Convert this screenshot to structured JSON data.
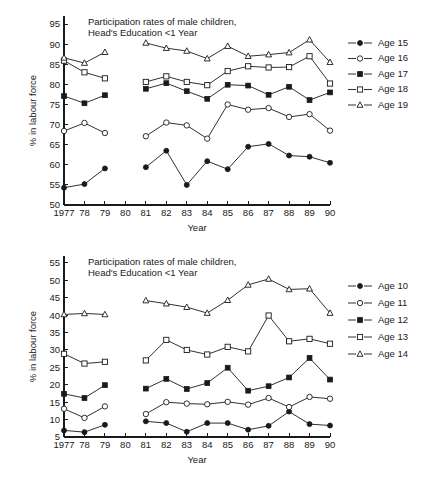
{
  "figure": {
    "background": "#ffffff",
    "ink_color": "#1a1a1a"
  },
  "chart_data": [
    {
      "id": "top",
      "type": "line",
      "title": "Participation rates of male children,\nHead's Education <1 Year",
      "title_line1": "Participation rates of male children,",
      "title_line2": "Head's Education <1 Year",
      "xlabel": "Year",
      "ylabel": "% in labour force",
      "ylim": [
        50,
        97
      ],
      "yticks": [
        50,
        55,
        60,
        65,
        70,
        75,
        80,
        85,
        90,
        95
      ],
      "ytick_labels": [
        "50",
        "55",
        "60",
        "65",
        "70",
        "75",
        "80",
        "85",
        "90",
        "95"
      ],
      "x": [
        1977,
        1978,
        1979,
        1980,
        1981,
        1982,
        1983,
        1984,
        1985,
        1986,
        1987,
        1988,
        1989,
        1990
      ],
      "xtick_labels": [
        "1977",
        "78",
        "79",
        "80",
        "81",
        "82",
        "83",
        "84",
        "85",
        "86",
        "87",
        "88",
        "89",
        "90"
      ],
      "grid": false,
      "legend_position": "right",
      "gap_years": [
        1980
      ],
      "series": [
        {
          "name": "Age 15",
          "marker": "filled-circle",
          "values": [
            54.3,
            55.2,
            59.1,
            null,
            59.4,
            63.5,
            55.0,
            60.9,
            58.9,
            64.5,
            65.2,
            62.3,
            62.0,
            60.5
          ]
        },
        {
          "name": "Age 16",
          "marker": "open-circle",
          "values": [
            68.4,
            70.4,
            67.9,
            null,
            67.1,
            70.5,
            69.8,
            66.5,
            75.0,
            73.7,
            74.1,
            71.9,
            72.6,
            68.5
          ]
        },
        {
          "name": "Age 17",
          "marker": "filled-square",
          "values": [
            77.1,
            75.3,
            77.3,
            null,
            78.9,
            80.3,
            78.3,
            76.4,
            79.9,
            79.7,
            77.4,
            79.4,
            76.1,
            78.0
          ]
        },
        {
          "name": "Age 18",
          "marker": "open-square",
          "values": [
            85.9,
            83.0,
            81.5,
            null,
            80.6,
            82.0,
            80.6,
            79.8,
            83.3,
            84.5,
            84.2,
            84.3,
            87.0,
            80.2
          ]
        },
        {
          "name": "Age 19",
          "marker": "open-triangle",
          "values": [
            86.6,
            85.3,
            88.0,
            null,
            90.3,
            89.0,
            88.3,
            86.4,
            89.5,
            87.0,
            87.4,
            87.9,
            91.1,
            85.5
          ]
        }
      ]
    },
    {
      "id": "bottom",
      "type": "line",
      "title": "Participation rates of male children,\nHead's Education <1 Year",
      "title_line1": "Participation rates of male children,",
      "title_line2": "Head's Education <1 Year",
      "xlabel": "Year",
      "ylabel": "% in labour force",
      "ylim": [
        5,
        57
      ],
      "yticks": [
        5,
        10,
        15,
        20,
        25,
        30,
        35,
        40,
        45,
        50,
        55
      ],
      "ytick_labels": [
        "5",
        "10",
        "15",
        "20",
        "25",
        "30",
        "35",
        "40",
        "45",
        "50",
        "55"
      ],
      "x": [
        1977,
        1978,
        1979,
        1980,
        1981,
        1982,
        1983,
        1984,
        1985,
        1986,
        1987,
        1988,
        1989,
        1990
      ],
      "xtick_labels": [
        "1977",
        "78",
        "79",
        "80",
        "81",
        "82",
        "83",
        "84",
        "85",
        "86",
        "87",
        "88",
        "89",
        "90"
      ],
      "grid": false,
      "legend_position": "right",
      "gap_years": [
        1980
      ],
      "series": [
        {
          "name": "Age 10",
          "marker": "filled-circle",
          "values": [
            6.9,
            6.4,
            8.5,
            null,
            9.5,
            9.0,
            6.5,
            9.0,
            9.0,
            7.1,
            8.2,
            12.3,
            8.7,
            8.3
          ]
        },
        {
          "name": "Age 11",
          "marker": "open-circle",
          "values": [
            13.1,
            10.5,
            13.8,
            null,
            11.6,
            15.0,
            14.6,
            14.4,
            15.1,
            14.3,
            16.2,
            13.6,
            16.5,
            16.0
          ]
        },
        {
          "name": "Age 12",
          "marker": "filled-square",
          "values": [
            17.4,
            16.2,
            19.9,
            null,
            18.9,
            21.7,
            18.8,
            20.5,
            24.9,
            18.3,
            19.6,
            22.1,
            27.7,
            21.5
          ]
        },
        {
          "name": "Age 13",
          "marker": "open-square",
          "values": [
            28.9,
            26.1,
            26.6,
            null,
            27.0,
            32.9,
            30.0,
            28.7,
            30.9,
            29.6,
            39.9,
            32.5,
            33.2,
            31.8
          ]
        },
        {
          "name": "Age 14",
          "marker": "open-triangle",
          "values": [
            40.2,
            40.5,
            40.2,
            null,
            44.2,
            43.3,
            42.3,
            40.6,
            44.3,
            48.7,
            50.4,
            47.4,
            47.6,
            40.6
          ]
        }
      ]
    }
  ]
}
